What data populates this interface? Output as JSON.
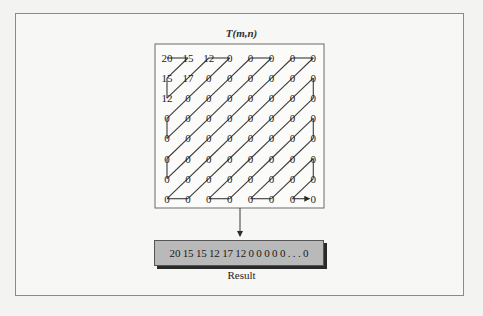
{
  "figure": {
    "title": "T(m,n)",
    "grid": {
      "rows": 8,
      "cols": 8,
      "values": [
        [
          "20",
          "15",
          "12",
          "0",
          "0",
          "0",
          "0",
          "0"
        ],
        [
          "15",
          "17",
          "0",
          "0",
          "0",
          "0",
          "0",
          "0"
        ],
        [
          "12",
          "0",
          "0",
          "0",
          "0",
          "0",
          "0",
          "0"
        ],
        [
          "0",
          "0",
          "0",
          "0",
          "0",
          "0",
          "0",
          "0"
        ],
        [
          "0",
          "0",
          "0",
          "0",
          "0",
          "0",
          "0",
          "0"
        ],
        [
          "0",
          "0",
          "0",
          "0",
          "0",
          "0",
          "0",
          "0"
        ],
        [
          "0",
          "0",
          "0",
          "0",
          "0",
          "0",
          "0",
          "0"
        ],
        [
          "0",
          "0",
          "0",
          "0",
          "0",
          "0",
          "0",
          "0"
        ]
      ],
      "scan_order": "zigzag",
      "end_arrow": true
    },
    "result": {
      "sequence": "20 15 15 12 17 12 0 0 0 0 0 . . . 0",
      "label": "Result"
    },
    "colors": {
      "line": "#3a3a3a",
      "result_fill": "#b9b9b9",
      "result_shadow": "#2a2a2a",
      "frame_border": "#8a8a8a"
    }
  }
}
